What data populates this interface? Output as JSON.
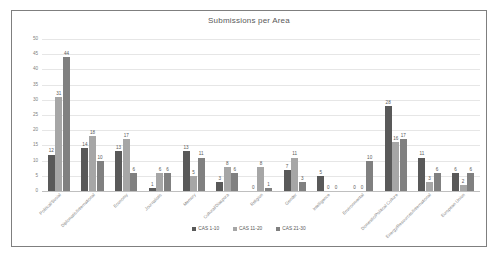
{
  "chart_data": {
    "type": "bar",
    "title": "Submissions per Area",
    "xlabel": "",
    "ylabel": "",
    "ylim": [
      0,
      50
    ],
    "ytick_step": 5,
    "yticks": [
      0,
      5,
      10,
      15,
      20,
      25,
      30,
      35,
      40,
      45,
      50
    ],
    "grid": true,
    "legend_position": "bottom",
    "categories": [
      "Political/Social",
      "Diplomatic/International",
      "Economy",
      "Journalistic",
      "Memory",
      "Cultural/Diaspora",
      "Religion",
      "Gender",
      "Intelligence",
      "Environmental",
      "Domestic/Political Culture",
      "Energy/Resources/International",
      "European Union"
    ],
    "series": [
      {
        "name": "CAS 1-10",
        "color": "#595959",
        "values": [
          12,
          14,
          13,
          1,
          13,
          3,
          0,
          7,
          5,
          0,
          28,
          11,
          6
        ]
      },
      {
        "name": "CAS 11-20",
        "color": "#a6a6a6",
        "values": [
          31,
          18,
          17,
          6,
          5,
          8,
          8,
          11,
          0,
          0,
          16,
          3,
          2
        ]
      },
      {
        "name": "CAS 21-30",
        "color": "#808080",
        "values": [
          44,
          10,
          6,
          6,
          11,
          6,
          1,
          3,
          0,
          10,
          17,
          6,
          6
        ]
      }
    ]
  }
}
